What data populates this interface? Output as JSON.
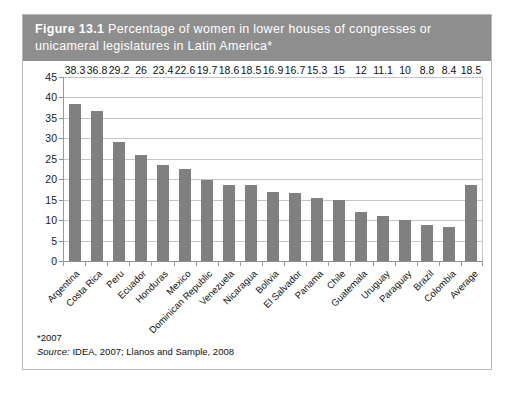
{
  "figure": {
    "number": "Figure 13.1",
    "title_line1": "Percentage of women in lower houses of congresses or",
    "title_line2": "unicameral legislatures in Latin America*",
    "header_color": "#8e8e8e",
    "bar_color": "#808080"
  },
  "footer": {
    "footnote": "*2007",
    "source_label": "Source:",
    "source_text": " IDEA, 2007; Llanos and Sample, 2008"
  },
  "chart_data": {
    "type": "bar",
    "title": "Figure 13.1 Percentage of women in lower houses of congresses or unicameral legislatures in Latin America*",
    "xlabel": "",
    "ylabel": "",
    "ylim": [
      0,
      45
    ],
    "yticks": [
      0,
      5,
      10,
      15,
      20,
      25,
      30,
      35,
      40,
      45
    ],
    "grid": true,
    "legend": "none",
    "categories": [
      "Argentina",
      "Costa Rica",
      "Peru",
      "Ecuador",
      "Honduras",
      "Mexico",
      "Dominican Republic",
      "Venezuela",
      "Nicaragua",
      "Bolivia",
      "El Salvador",
      "Panama",
      "Chile",
      "Guatemala",
      "Uruguay",
      "Paraguay",
      "Brazil",
      "Colombia",
      "Average"
    ],
    "values": [
      38.3,
      36.8,
      29.2,
      26,
      23.4,
      22.6,
      19.7,
      18.6,
      18.5,
      16.9,
      16.7,
      15.3,
      15,
      12,
      11.1,
      10,
      8.8,
      8.4,
      18.5
    ],
    "value_labels": [
      "38.3",
      "36.8",
      "29.2",
      "26",
      "23.4",
      "22.6",
      "19.7",
      "18.6",
      "18.5",
      "16.9",
      "16.7",
      "15.3",
      "15",
      "12",
      "11.1",
      "10",
      "8.8",
      "8.4",
      "18.5"
    ]
  }
}
